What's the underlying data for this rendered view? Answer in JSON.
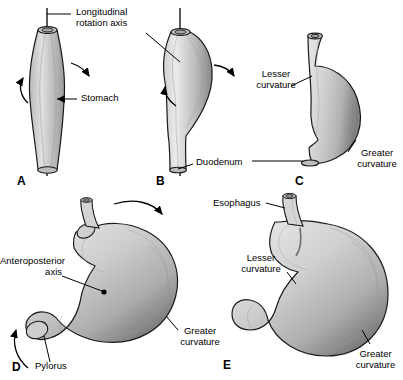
{
  "figure": {
    "background_color": "#ffffff",
    "line_color": "#000000",
    "organ_fill_light": "#d8d8d8",
    "organ_fill_mid": "#b8b8b8",
    "organ_fill_dark": "#8f8f8f",
    "organ_outline": "#1a1a1a"
  },
  "panels": [
    {
      "id": "A",
      "letter": "A"
    },
    {
      "id": "B",
      "letter": "B"
    },
    {
      "id": "C",
      "letter": "C"
    },
    {
      "id": "D",
      "letter": "D"
    },
    {
      "id": "E",
      "letter": "E"
    }
  ],
  "labels": {
    "longitudinal_axis_line1": "Longitudinal",
    "longitudinal_axis_line2": "rotation axis",
    "stomach": "Stomach",
    "duodenum": "Duodenum",
    "lesser_c_line1": "Lesser",
    "lesser_c_line2": "curvature",
    "greater_c_line1": "Greater",
    "greater_c_line2": "curvature",
    "anteroposterior_line1": "Anteroposterior",
    "anteroposterior_line2": "axis",
    "pylorus": "Pylorus",
    "esophagus": "Esophagus",
    "lesser_c_e_line1": "Lesser",
    "lesser_c_e_line2": "curvature",
    "greater_c_e_line1": "Greater",
    "greater_c_e_line2": "curvature"
  }
}
